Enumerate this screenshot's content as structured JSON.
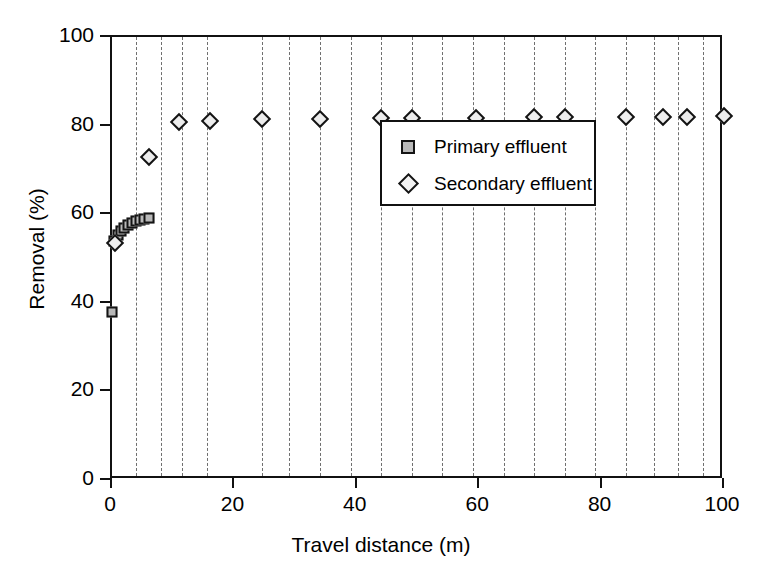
{
  "chart_data": {
    "type": "scatter",
    "title": "",
    "xlabel": "Travel distance (m)",
    "ylabel": "Removal (%)",
    "xlim": [
      0,
      100
    ],
    "ylim": [
      0,
      100
    ],
    "xticks": [
      "0",
      "20",
      "40",
      "60",
      "80",
      "100"
    ],
    "xtick_values": [
      0,
      20,
      40,
      60,
      80,
      100
    ],
    "yticks": [
      "0",
      "20",
      "40",
      "60",
      "80",
      "100"
    ],
    "ytick_values": [
      0,
      20,
      40,
      60,
      80,
      100
    ],
    "grid": "vertical-dashed",
    "legend_position": "upper-right-inside",
    "series": [
      {
        "name": "Primary effluent",
        "marker": "square",
        "marker_fill": "#b9b9b9",
        "marker_edge": "#141414",
        "x": [
          0.0,
          0.4,
          0.9,
          1.4,
          2.0,
          2.6,
          3.2,
          3.9,
          4.6,
          5.3,
          6.0
        ],
        "y": [
          38.0,
          54.0,
          55.2,
          56.1,
          56.9,
          57.5,
          58.0,
          58.4,
          58.7,
          59.0,
          59.2
        ]
      },
      {
        "name": "Secondary effluent",
        "marker": "diamond",
        "marker_fill": "#ededed",
        "marker_edge": "#141414",
        "x": [
          0.5,
          6.0,
          11.0,
          16.0,
          24.5,
          34.0,
          44.0,
          49.0,
          59.5,
          69.0,
          74.0,
          84.0,
          90.0,
          94.0,
          100.0
        ],
        "y": [
          53.5,
          73.0,
          80.8,
          81.0,
          81.4,
          81.6,
          81.7,
          81.7,
          81.8,
          81.9,
          81.9,
          82.0,
          82.0,
          82.0,
          82.1
        ]
      }
    ],
    "gridline_x": [
      4.0,
      8.0,
      11.5,
      15.5,
      24.5,
      29.0,
      34.0,
      39.0,
      44.0,
      49.0,
      54.0,
      59.0,
      64.0,
      69.0,
      74.0,
      79.0,
      84.0,
      88.5,
      92.5,
      96.5
    ]
  },
  "legend": {
    "entries": [
      {
        "label": "Primary effluent",
        "marker": "square-marker"
      },
      {
        "label": "Secondary effluent",
        "marker": "diamond-marker"
      }
    ]
  },
  "colors": {
    "axis": "#111111",
    "grid": "#6f6f6f",
    "primary_fill": "#b9b9b9",
    "secondary_fill": "#ededed",
    "marker_edge": "#141414",
    "background": "#ffffff"
  }
}
